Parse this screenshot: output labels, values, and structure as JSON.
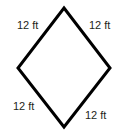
{
  "figure": {
    "name": "rhombus-with-side-lengths",
    "shape": "rhombus",
    "background_color": "#ffffff",
    "stroke_color": "#000000",
    "stroke_width_px": 3,
    "text_color": "#231f20",
    "vertices": {
      "top": [
        64,
        8
      ],
      "right": [
        110,
        68
      ],
      "bottom": [
        64,
        127
      ],
      "left": [
        18,
        68
      ]
    },
    "polygon_points": "64,8 110,68 64,127 18,68",
    "labels": {
      "top_left": "12 ft",
      "top_right": "12 ft",
      "bottom_left": "12 ft",
      "bottom_right": "12 ft"
    }
  }
}
